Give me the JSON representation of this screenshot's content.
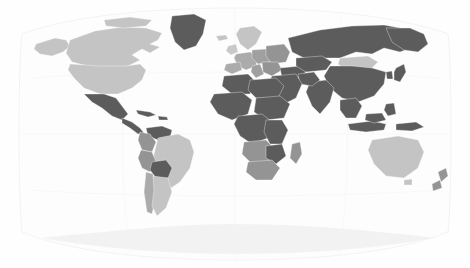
{
  "map": {
    "title": "World choropleth map",
    "projection": "robinson",
    "background_color": "#fefefe",
    "ocean_color": "#fdfdfd",
    "graticule_color": "#f0f0f0",
    "border_color": "#ffffff",
    "width": 470,
    "height": 268,
    "legend_visible": false,
    "labels_visible": false,
    "shade_scale": {
      "light": "#c4c4c4",
      "medium_light": "#ababab",
      "medium": "#949494",
      "dark": "#5c5c5c",
      "very_light": "#f2f2f2"
    },
    "regions": [
      {
        "name": "canada",
        "shade": "light"
      },
      {
        "name": "alaska",
        "shade": "light"
      },
      {
        "name": "united-states",
        "shade": "light"
      },
      {
        "name": "greenland",
        "shade": "dark"
      },
      {
        "name": "mexico",
        "shade": "dark"
      },
      {
        "name": "central-america",
        "shade": "dark"
      },
      {
        "name": "caribbean",
        "shade": "dark"
      },
      {
        "name": "venezuela",
        "shade": "dark"
      },
      {
        "name": "colombia",
        "shade": "medium"
      },
      {
        "name": "brazil",
        "shade": "light"
      },
      {
        "name": "peru",
        "shade": "medium"
      },
      {
        "name": "bolivia",
        "shade": "dark"
      },
      {
        "name": "chile",
        "shade": "medium_light"
      },
      {
        "name": "argentina",
        "shade": "light"
      },
      {
        "name": "scandinavia",
        "shade": "light"
      },
      {
        "name": "western-europe",
        "shade": "medium_light"
      },
      {
        "name": "eastern-europe",
        "shade": "medium"
      },
      {
        "name": "russia",
        "shade": "dark"
      },
      {
        "name": "mongolia",
        "shade": "light"
      },
      {
        "name": "china",
        "shade": "dark"
      },
      {
        "name": "india",
        "shade": "dark"
      },
      {
        "name": "middle-east",
        "shade": "dark"
      },
      {
        "name": "north-africa",
        "shade": "dark"
      },
      {
        "name": "west-africa",
        "shade": "dark"
      },
      {
        "name": "central-africa",
        "shade": "dark"
      },
      {
        "name": "east-africa",
        "shade": "dark"
      },
      {
        "name": "southern-africa",
        "shade": "medium"
      },
      {
        "name": "madagascar",
        "shade": "medium"
      },
      {
        "name": "indonesia",
        "shade": "dark"
      },
      {
        "name": "philippines",
        "shade": "dark"
      },
      {
        "name": "australia",
        "shade": "light"
      },
      {
        "name": "new-zealand",
        "shade": "medium"
      },
      {
        "name": "antarctica",
        "shade": "very_light"
      }
    ]
  }
}
